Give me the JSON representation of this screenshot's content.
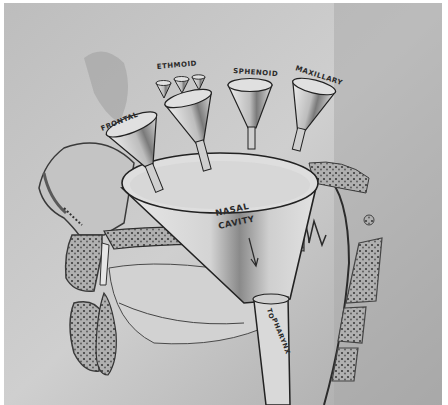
{
  "figure": {
    "colors": {
      "background": "#b9b9b9",
      "background_light": "#d6d6d6",
      "funnel_fill": "#dcdcdc",
      "outline": "#2b2b2b",
      "bone": "#8f8f8f",
      "border": "#ffffff"
    }
  },
  "labels": {
    "frontal": "FRONTAL",
    "ethmoid": "ETHMOID",
    "sphenoid": "SPHENOID",
    "maxillary": "MAXILLARY",
    "nasal_cavity_line1": "NASAL",
    "nasal_cavity_line2": "CAVITY",
    "to_pharynx_line1": "TO",
    "to_pharynx_line2": "PHARYNX"
  }
}
